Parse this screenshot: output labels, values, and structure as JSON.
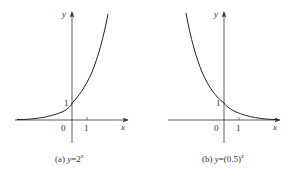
{
  "figures": [
    {
      "id": "a",
      "caption_prefix": "(a) ",
      "caption_y": "y",
      "caption_eq": "=2",
      "caption_sup": "x",
      "function": "y=2^x",
      "x_axis_label": "x",
      "y_axis_label": "y",
      "origin_label": "0",
      "x_tick_label": "1",
      "y_intercept_label": "1"
    },
    {
      "id": "b",
      "caption_prefix": "(b) ",
      "caption_y": "y",
      "caption_eq": "=(0.5)",
      "caption_sup": "x",
      "function": "y=(0.5)^x",
      "x_axis_label": "x",
      "y_axis_label": "y",
      "origin_label": "0",
      "x_tick_label": "1",
      "y_intercept_label": "1"
    }
  ],
  "colors": {
    "curve": "#222222",
    "axis": "#333333",
    "background": "#ffffff"
  }
}
